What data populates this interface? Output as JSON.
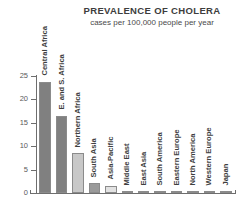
{
  "header": {
    "title": "PREVALENCE OF CHOLERA",
    "subtitle": "cases per 100,000 people per year"
  },
  "axis": {
    "y_ticks": [
      "0",
      "5",
      "10",
      "15",
      "20",
      "25"
    ]
  },
  "chart_data": {
    "type": "bar",
    "title": "PREVALENCE OF CHOLERA",
    "subtitle": "cases per 100,000 people per year",
    "xlabel": "",
    "ylabel": "cases per 100,000 people per year",
    "ylim": [
      0,
      25
    ],
    "yticks": [
      0,
      5,
      10,
      15,
      20,
      25
    ],
    "grid": false,
    "legend": false,
    "categories": [
      "Central Africa",
      "E. and S. Africa",
      "Northern Africa",
      "South Asia",
      "Asia-Pacific",
      "Middle East",
      "East Asia",
      "South America",
      "Eastern Europe",
      "North America",
      "Western Europe",
      "Japan"
    ],
    "values": [
      23.8,
      16.5,
      8.5,
      2.1,
      1.6,
      0.3,
      0.05,
      0.3,
      0.35,
      0.05,
      0.05,
      0.02
    ],
    "colors": [
      "#808080",
      "#808080",
      "#c8c8c8",
      "#9a9a9a",
      "#e2e2e2",
      "#9a9a9a",
      "#c8c8c8",
      "#9a9a9a",
      "#808080",
      "#c8c8c8",
      "#c8c8c8",
      "#c8c8c8"
    ]
  },
  "style": {
    "axis_color": "#6e6e6e",
    "text_color": "#3f3f3f"
  }
}
